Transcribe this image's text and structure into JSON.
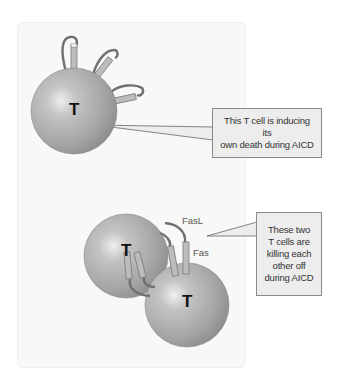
{
  "diagram": {
    "cells": [
      {
        "id": "t-cell-self",
        "label": "T"
      },
      {
        "id": "t-cell-upper",
        "label": "T"
      },
      {
        "id": "t-cell-lower",
        "label": "T"
      }
    ],
    "molecules": {
      "fasl_label": "FasL",
      "fas_label": "Fas"
    },
    "callouts": [
      {
        "text": "This T cell is inducing its\nown death during AICD"
      },
      {
        "text": "These two\nT cells are\nkilling each\nother off\nduring AICD"
      }
    ],
    "colors": {
      "cell_fill": "#a9a9a9",
      "cell_highlight": "#ececec",
      "callout_fill": "#ededed",
      "callout_border": "#8a8a8a",
      "panel_bg": "#f8f8f7",
      "receptor_fill": "#b5b5b5",
      "ligand_stroke": "#7a7a7a"
    }
  }
}
